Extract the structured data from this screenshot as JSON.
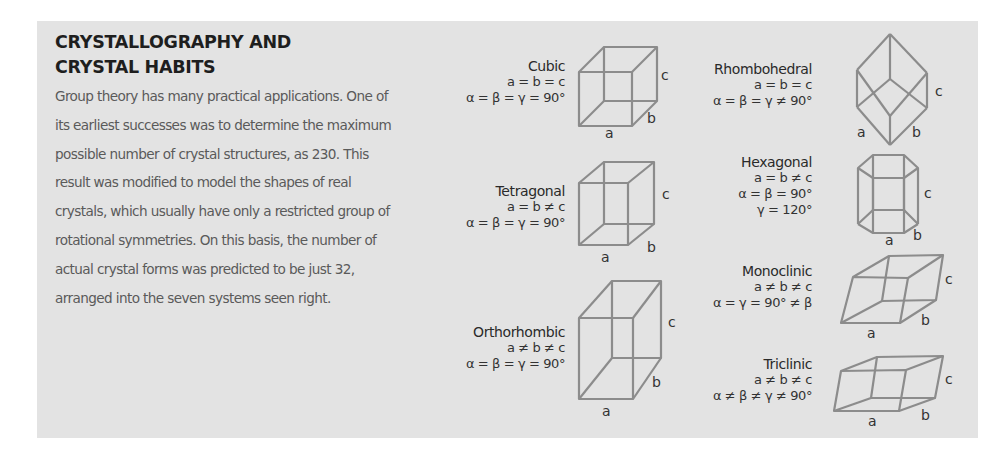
{
  "title": "CRYSTALLOGRAPHY AND CRYSTAL HABITS",
  "title_lines": [
    "CRYSTALLOGRAPHY AND",
    "CRYSTAL HABITS"
  ],
  "body": "Group theory has many practical applications. One of its earliest successes was to determine the maximum possible number of crystal structures, as 230. This result was modified to model the shapes of real crystals, which usually have only a restricted group of rotational symmetries. On this basis, the number of actual crystal forms was predicted to be just 32, arranged into the seven systems seen right.",
  "colors": {
    "panel_background": "#e3e3e3",
    "title": "#1e1e1e",
    "body_text": "#5a5a5a",
    "shape_stroke": "#8c8c8c"
  },
  "axis_labels": {
    "a": "a",
    "b": "b",
    "c": "c"
  },
  "systems": [
    {
      "id": "cubic",
      "name": "Cubic",
      "lines": [
        "a = b = c",
        "α = β = γ = 90°"
      ]
    },
    {
      "id": "tetragonal",
      "name": "Tetragonal",
      "lines": [
        "a = b ≠ c",
        "α = β = γ = 90°"
      ]
    },
    {
      "id": "orthorhombic",
      "name": "Orthorhombic",
      "lines": [
        "a ≠ b ≠ c",
        "α = β = γ = 90°"
      ]
    },
    {
      "id": "rhombohedral",
      "name": "Rhombohedral",
      "lines": [
        "a = b = c",
        "α = β = γ ≠ 90°"
      ]
    },
    {
      "id": "hexagonal",
      "name": "Hexagonal",
      "lines": [
        "a = b ≠ c",
        "α = β = 90°",
        "γ = 120°"
      ]
    },
    {
      "id": "monoclinic",
      "name": "Monoclinic",
      "lines": [
        "a ≠ b ≠ c",
        "α =  γ = 90° ≠ β"
      ]
    },
    {
      "id": "triclinic",
      "name": "Triclinic",
      "lines": [
        "a ≠ b ≠ c",
        "α ≠ β ≠ γ ≠ 90°"
      ]
    }
  ]
}
